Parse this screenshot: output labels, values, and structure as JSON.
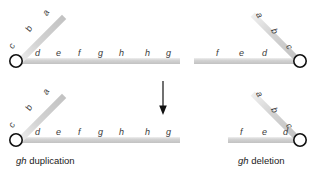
{
  "figure": {
    "type": "genetics-diagram",
    "title": "",
    "background_color": "#ffffff",
    "chromosome_color": "#c9c9c9",
    "chromosome_highlight": "#eeeeee",
    "centromere_stroke": "#1a1a1a",
    "label_color": "#3b3b3b",
    "caption_color": "#1a1a1a",
    "arrow_color": "#111111"
  },
  "arrow": {
    "name": "downward-arrow",
    "direction": "down",
    "x": 163,
    "y_start": 81,
    "y_end": 114
  },
  "panels": [
    {
      "id": "top-left",
      "name": "parent-chromosome-left",
      "orientation": "centromere-left",
      "caption": "",
      "short_arm_bands": [
        "c",
        "b",
        "a"
      ],
      "long_arm_bands": [
        "d",
        "e",
        "f",
        "g",
        "h",
        "h",
        "g"
      ]
    },
    {
      "id": "top-right",
      "name": "parent-chromosome-right",
      "orientation": "centromere-right",
      "caption": "",
      "short_arm_bands": [
        "a",
        "b",
        "c"
      ],
      "long_arm_bands": [
        "f",
        "e",
        "d"
      ]
    },
    {
      "id": "bottom-left",
      "name": "duplication-chromosome",
      "orientation": "centromere-left",
      "caption_italic": "gh",
      "caption_rest": " duplication",
      "short_arm_bands": [
        "c",
        "b",
        "a"
      ],
      "long_arm_bands": [
        "d",
        "e",
        "f",
        "g",
        "h",
        "h",
        "g"
      ]
    },
    {
      "id": "bottom-right",
      "name": "deletion-chromosome",
      "orientation": "centromere-right",
      "caption_italic": "gh",
      "caption_rest": " deletion",
      "short_arm_bands": [
        "a",
        "b",
        "c"
      ],
      "long_arm_bands": [
        "f",
        "e",
        "d"
      ]
    }
  ],
  "band_labels": {
    "top_left_short": [
      {
        "text": "c",
        "x": 7,
        "y": 46,
        "rot": -62
      },
      {
        "text": "b",
        "x": 24,
        "y": 29,
        "rot": -62
      },
      {
        "text": "a",
        "x": 41,
        "y": 13,
        "rot": -62
      }
    ],
    "top_left_long": [
      {
        "text": "d",
        "x": 35,
        "y": 49
      },
      {
        "text": "e",
        "x": 56,
        "y": 49
      },
      {
        "text": "f",
        "x": 78,
        "y": 49
      },
      {
        "text": "g",
        "x": 98,
        "y": 49
      },
      {
        "text": "h",
        "x": 119,
        "y": 49
      },
      {
        "text": "h",
        "x": 145,
        "y": 49
      },
      {
        "text": "g",
        "x": 166,
        "y": 49
      }
    ],
    "top_right_short": [
      {
        "text": "a",
        "x": 262,
        "y": 11,
        "rot": 62
      },
      {
        "text": "b",
        "x": 277,
        "y": 27,
        "rot": 62
      },
      {
        "text": "c",
        "x": 292,
        "y": 43,
        "rot": 62
      }
    ],
    "top_right_long": [
      {
        "text": "f",
        "x": 216,
        "y": 49
      },
      {
        "text": "e",
        "x": 239,
        "y": 49
      },
      {
        "text": "d",
        "x": 262,
        "y": 49
      }
    ],
    "bottom_left_short": [
      {
        "text": "c",
        "x": 7,
        "y": 125,
        "rot": -62
      },
      {
        "text": "b",
        "x": 24,
        "y": 108,
        "rot": -62
      },
      {
        "text": "a",
        "x": 41,
        "y": 92,
        "rot": -62
      }
    ],
    "bottom_left_long": [
      {
        "text": "d",
        "x": 35,
        "y": 128
      },
      {
        "text": "e",
        "x": 56,
        "y": 128
      },
      {
        "text": "f",
        "x": 78,
        "y": 128
      },
      {
        "text": "g",
        "x": 98,
        "y": 128
      },
      {
        "text": "h",
        "x": 119,
        "y": 128
      },
      {
        "text": "h",
        "x": 145,
        "y": 128
      },
      {
        "text": "g",
        "x": 166,
        "y": 128
      }
    ],
    "bottom_right_short": [
      {
        "text": "a",
        "x": 262,
        "y": 90,
        "rot": 62
      },
      {
        "text": "b",
        "x": 277,
        "y": 106,
        "rot": 62
      },
      {
        "text": "c",
        "x": 292,
        "y": 122,
        "rot": 62
      }
    ],
    "bottom_right_long": [
      {
        "text": "f",
        "x": 240,
        "y": 128
      },
      {
        "text": "e",
        "x": 262,
        "y": 128
      },
      {
        "text": "d",
        "x": 283,
        "y": 128
      }
    ]
  },
  "captions": [
    {
      "name": "caption-gh-duplication",
      "italic": "gh",
      "rest": " duplication",
      "x": 16,
      "y": 156
    },
    {
      "name": "caption-gh-deletion",
      "italic": "gh",
      "rest": " deletion",
      "x": 238,
      "y": 156
    }
  ]
}
